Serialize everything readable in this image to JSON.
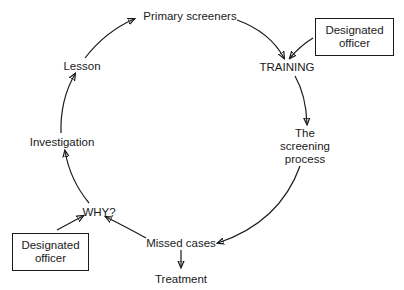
{
  "diagram": {
    "type": "cycle",
    "nodes": {
      "primary_screeners": "Primary screeners",
      "training": "TRAINING",
      "screening_process": [
        "The",
        "screening",
        "process"
      ],
      "missed_cases": "Missed cases",
      "treatment": "Treatment",
      "why": "WHY?",
      "investigation": "Investigation",
      "lesson": "Lesson"
    },
    "boxes": {
      "officer_top": [
        "Designated",
        "officer"
      ],
      "officer_bottom": [
        "Designated",
        "officer"
      ]
    },
    "edges": [
      {
        "from": "Primary screeners",
        "to": "TRAINING"
      },
      {
        "from": "Designated officer (top)",
        "to": "TRAINING"
      },
      {
        "from": "TRAINING",
        "to": "The screening process"
      },
      {
        "from": "The screening process",
        "to": "Missed cases"
      },
      {
        "from": "Missed cases",
        "to": "Treatment"
      },
      {
        "from": "Missed cases",
        "to": "WHY?"
      },
      {
        "from": "Designated officer (bottom)",
        "to": "WHY?"
      },
      {
        "from": "WHY?",
        "to": "Investigation"
      },
      {
        "from": "Investigation",
        "to": "Lesson"
      },
      {
        "from": "Lesson",
        "to": "Primary screeners"
      }
    ]
  }
}
